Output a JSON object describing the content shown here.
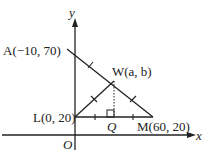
{
  "axes": {
    "x_label": "x",
    "y_label": "y",
    "origin_label": "O"
  },
  "points": {
    "A": {
      "name": "A",
      "coords": "(−10, 70)",
      "label": "A(−10, 70)"
    },
    "W": {
      "name": "W",
      "coords": "(a, b)",
      "label": "W(a, b)"
    },
    "L": {
      "name": "L",
      "coords": "(0, 20)",
      "label": "L(0, 20)"
    },
    "M": {
      "name": "M",
      "coords": "(60, 20)",
      "label": "M(60, 20)"
    },
    "Q": {
      "name": "Q",
      "label": "Q"
    }
  },
  "segments": [
    "AW",
    "WM",
    "LW",
    "LM",
    "WQ (dotted, perpendicular)"
  ],
  "markings": {
    "tick_marks": "single ticks on AW, WM, LW, LQ, QM indicating equal lengths",
    "right_angle": "at Q"
  }
}
